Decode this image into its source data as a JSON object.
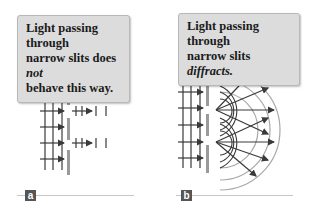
{
  "panels": [
    {
      "id": "a",
      "label": "a",
      "callout": {
        "line1": "Light passing through",
        "line2_prefix": "narrow slits does ",
        "line2_emphasis": "not",
        "line3": "behave this way."
      },
      "description": "Plane waves pass straight through slits without spreading"
    },
    {
      "id": "b",
      "label": "b",
      "callout": {
        "line1": "Light passing through",
        "line2_prefix": "narrow slits ",
        "line2_emphasis": "diffracts."
      },
      "description": "Plane waves spread out as circular wavefronts from slits"
    }
  ],
  "colors": {
    "callout_bg": "#dcdcdc",
    "line": "#3a3a3a",
    "barrier": "#9a9a9a",
    "arc": "#a8a8a8",
    "label_bg": "#555555",
    "baseline": "#c7c7c7"
  }
}
